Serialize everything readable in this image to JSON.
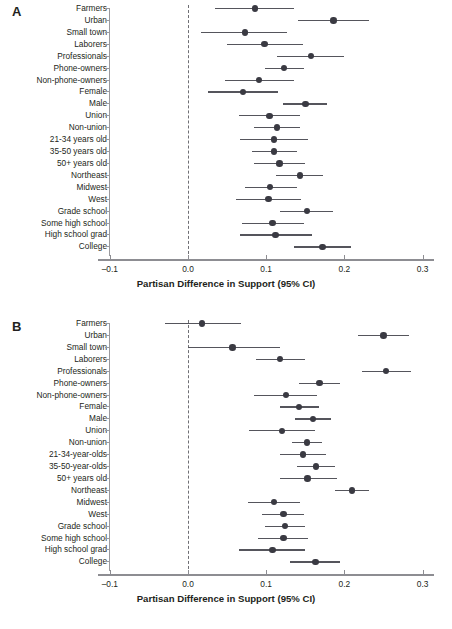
{
  "figure": {
    "width": 452,
    "height": 629,
    "panels": [
      "A",
      "B"
    ]
  },
  "axis": {
    "title": "Partisan Difference in Support (95% CI)",
    "ticks": [
      "-0.1",
      "0.0",
      "0.1",
      "0.2",
      "0.3"
    ],
    "tick_values": [
      -0.1,
      0.0,
      0.1,
      0.2,
      0.3
    ],
    "xmin": -0.115,
    "xmax": 0.315,
    "zero_reference": 0.0
  },
  "style": {
    "dot_color": "#3a3a42",
    "ci_color": "#55555c",
    "axis_color": "#8d8d92",
    "zero_line_color": "#6f6f74",
    "text_color": "#231f20"
  },
  "chart_data": [
    {
      "type": "scatter",
      "panel": "A",
      "title": "A",
      "xlabel": "Partisan Difference in Support (95% CI)",
      "ylabel": "",
      "xlim": [
        -0.115,
        0.315
      ],
      "xticks": [
        -0.1,
        0.0,
        0.1,
        0.2,
        0.3
      ],
      "grid": false,
      "legend": "none",
      "annotations": [
        "dashed vertical reference line at 0.0"
      ],
      "categories": [
        "Farmers",
        "Urban",
        "Small town",
        "Laborers",
        "Professionals",
        "Phone-owners",
        "Non-phone-owners",
        "Female",
        "Male",
        "Union",
        "Non-union",
        "21-34 years old",
        "35-50 years old",
        "50+ years old",
        "Northeast",
        "Midwest",
        "West",
        "Grade school",
        "Some high school",
        "High school grad",
        "College"
      ],
      "values": [
        0.086,
        0.186,
        0.073,
        0.098,
        0.157,
        0.123,
        0.091,
        0.07,
        0.15,
        0.104,
        0.114,
        0.11,
        0.11,
        0.117,
        0.143,
        0.105,
        0.103,
        0.152,
        0.108,
        0.112,
        0.172
      ],
      "ci_low": [
        0.035,
        0.141,
        0.016,
        0.05,
        0.114,
        0.099,
        0.047,
        0.025,
        0.122,
        0.065,
        0.085,
        0.066,
        0.082,
        0.085,
        0.113,
        0.073,
        0.061,
        0.118,
        0.069,
        0.066,
        0.136
      ],
      "ci_high": [
        0.135,
        0.231,
        0.127,
        0.147,
        0.2,
        0.148,
        0.136,
        0.115,
        0.178,
        0.143,
        0.143,
        0.153,
        0.139,
        0.15,
        0.173,
        0.139,
        0.145,
        0.186,
        0.148,
        0.158,
        0.209
      ]
    },
    {
      "type": "scatter",
      "panel": "B",
      "title": "B",
      "xlabel": "Partisan Difference in Support (95% CI)",
      "ylabel": "",
      "xlim": [
        -0.115,
        0.315
      ],
      "xticks": [
        -0.1,
        0.0,
        0.1,
        0.2,
        0.3
      ],
      "grid": false,
      "legend": "none",
      "annotations": [
        "dashed vertical reference line at 0.0"
      ],
      "categories": [
        "Farmers",
        "Urban",
        "Small town",
        "Laborers",
        "Professionals",
        "Phone-owners",
        "Non-phone-owners",
        "Female",
        "Male",
        "Union",
        "Non-union",
        "21-34-year-olds",
        "35-50-year-olds",
        "50+ years old",
        "Northeast",
        "Midwest",
        "West",
        "Grade school",
        "Some high school",
        "High school grad",
        "College"
      ],
      "values": [
        0.018,
        0.25,
        0.057,
        0.118,
        0.253,
        0.168,
        0.125,
        0.142,
        0.16,
        0.12,
        0.152,
        0.147,
        0.164,
        0.153,
        0.21,
        0.11,
        0.122,
        0.124,
        0.122,
        0.108,
        0.163,
        0.197
      ],
      "ci_low": [
        -0.03,
        0.217,
        0.0,
        0.087,
        0.223,
        0.142,
        0.085,
        0.118,
        0.137,
        0.078,
        0.133,
        0.118,
        0.14,
        0.118,
        0.188,
        0.077,
        0.095,
        0.098,
        0.09,
        0.065,
        0.131,
        0.167
      ],
      "ci_high": [
        0.068,
        0.283,
        0.118,
        0.15,
        0.285,
        0.195,
        0.165,
        0.168,
        0.183,
        0.163,
        0.172,
        0.177,
        0.188,
        0.19,
        0.232,
        0.143,
        0.148,
        0.15,
        0.154,
        0.15,
        0.195,
        0.232
      ]
    }
  ]
}
